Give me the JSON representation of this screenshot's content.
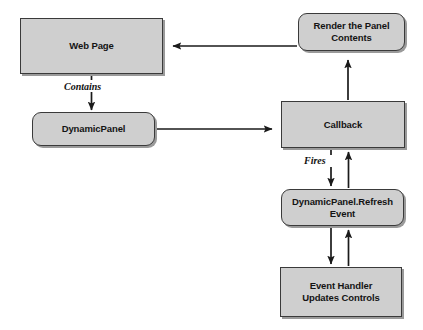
{
  "diagram": {
    "canvas": {
      "width": 423,
      "height": 330,
      "background": "#ffffff"
    },
    "style": {
      "node_fill": "#cfcfcf",
      "node_border": "#3a3a3a",
      "node_shadow": "#9a9a9a",
      "text_color": "#141414",
      "arrow_color": "#1a1a1a"
    },
    "nodes": [
      {
        "id": "web-page",
        "label": "Web Page",
        "shape": "rectangle",
        "x": 20,
        "y": 18,
        "width": 143,
        "height": 56
      },
      {
        "id": "dynamic-panel",
        "label": "DynamicPanel",
        "shape": "rounded-rectangle",
        "x": 32,
        "y": 112,
        "width": 123,
        "height": 34
      },
      {
        "id": "render-panel-contents",
        "label": "Render the Panel\nContents",
        "shape": "rounded-rectangle",
        "x": 298,
        "y": 13,
        "width": 107,
        "height": 38
      },
      {
        "id": "callback",
        "label": "Callback",
        "shape": "rectangle",
        "x": 281,
        "y": 101,
        "width": 124,
        "height": 47
      },
      {
        "id": "dynamicpanel-refresh-event",
        "label": "DynamicPanel.Refresh\nEvent",
        "shape": "rounded-rectangle",
        "x": 281,
        "y": 189,
        "width": 123,
        "height": 37
      },
      {
        "id": "event-handler-updates-controls",
        "label": "Event Handler\nUpdates Controls",
        "shape": "rectangle",
        "x": 280,
        "y": 267,
        "width": 122,
        "height": 50
      }
    ],
    "edges": [
      {
        "id": "render-to-webpage",
        "from": "render-panel-contents",
        "to": "web-page",
        "label": "",
        "direction": "left"
      },
      {
        "id": "webpage-to-dynamicpanel",
        "from": "web-page",
        "to": "dynamic-panel",
        "label": "Contains",
        "direction": "down"
      },
      {
        "id": "dynamicpanel-to-callback",
        "from": "dynamic-panel",
        "to": "callback",
        "label": "",
        "direction": "right"
      },
      {
        "id": "callback-to-render",
        "from": "callback",
        "to": "render-panel-contents",
        "label": "",
        "direction": "up"
      },
      {
        "id": "callback-to-refresh-event",
        "from": "callback",
        "to": "dynamicpanel-refresh-event",
        "label": "Fires",
        "direction": "down"
      },
      {
        "id": "refresh-event-to-callback",
        "from": "dynamicpanel-refresh-event",
        "to": "callback",
        "label": "",
        "direction": "up"
      },
      {
        "id": "refresh-event-to-event-handler",
        "from": "dynamicpanel-refresh-event",
        "to": "event-handler-updates-controls",
        "label": "",
        "direction": "down"
      },
      {
        "id": "event-handler-to-refresh-event",
        "from": "event-handler-updates-controls",
        "to": "dynamicpanel-refresh-event",
        "label": "",
        "direction": "up"
      }
    ],
    "edge_labels": [
      {
        "id": "contains-label",
        "text": "Contains",
        "x": 63,
        "y": 81
      },
      {
        "id": "fires-label",
        "text": "Fires",
        "x": 303,
        "y": 157
      }
    ]
  }
}
